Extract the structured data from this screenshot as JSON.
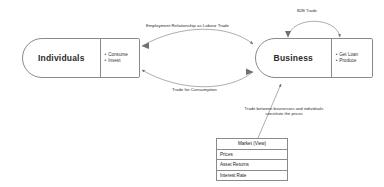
{
  "diagram": {
    "stroke_color": "#8a8a8a",
    "text_color": "#2f2f2f",
    "background": "#ffffff"
  },
  "nodes": {
    "individuals": {
      "label": "Individuals",
      "operations": [
        {
          "bullet": "•",
          "text": "Consume"
        },
        {
          "bullet": "•",
          "text": "Invest"
        }
      ]
    },
    "business": {
      "label": "Business",
      "operations": [
        {
          "bullet": "•",
          "text": "Get Loan"
        },
        {
          "bullet": "•",
          "text": "Produce"
        }
      ]
    }
  },
  "edges": {
    "labour_trade": "Employment Relationship as Labour Trade",
    "trade_for_consumption": "Trade for Consumption",
    "b2b_trade": "B2B Trade"
  },
  "annotations": {
    "price_note_line1": "Trade between businesses and individuals",
    "price_note_line2": "constitute the prices"
  },
  "market_table": {
    "header": "Market (View)",
    "rows": [
      "Prices",
      "Asset Returns",
      "Interest Rate"
    ]
  }
}
